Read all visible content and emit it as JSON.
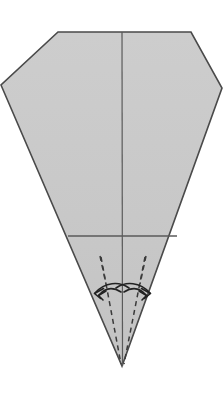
{
  "document": {
    "title": "Origami Fold Diagram",
    "type": "instructional-fold-step",
    "background_color": "#ffffff",
    "caption": ""
  },
  "figure": {
    "name": "kite-base-fold-step",
    "canvas": {
      "width": 223,
      "height": 393
    }
  },
  "style": {
    "paper_fill": "#c9c9c9",
    "paper_fill_light": "#cfcfcf",
    "outline_color": "#4a4a4a",
    "outline_width": 1.6,
    "crease_color": "#5a5a5a",
    "crease_width": 1.2,
    "dashed_color": "#3a3a3a",
    "dashed_width": 1.5,
    "dash_pattern": "5,4",
    "arrow_color": "#222222",
    "arrow_width": 1.6
  },
  "shapes": {
    "paper_outline": {
      "name": "paper-silhouette",
      "points": "58,32 191,32 222,88 122,366 1,85"
    },
    "center_crease": {
      "name": "center-vertical-crease",
      "x1": 122,
      "y1": 32,
      "x2": 122.5,
      "y2": 366
    },
    "horizontal_fold": {
      "name": "horizontal-fold-line",
      "x1": 68,
      "y1": 236,
      "x2": 177,
      "y2": 236
    }
  },
  "fold_lines": [
    {
      "name": "dashed-valley-fold-left",
      "x1": 101,
      "y1": 257,
      "x2": 121,
      "y2": 364
    },
    {
      "name": "dashed-valley-fold-right",
      "x1": 145,
      "y1": 257,
      "x2": 124,
      "y2": 364
    }
  ],
  "arrows": [
    {
      "name": "fold-arrow-left-outer",
      "path": "M 128,289 C 118,282 104,283 95,293",
      "head": "95,293 103,290 100,297"
    },
    {
      "name": "fold-arrow-left-inner",
      "path": "M 120,292 C 112,287 104,288 98,295",
      "head": "98,295 105,292 103,299"
    },
    {
      "name": "fold-arrow-right-outer",
      "path": "M 117,289 C 127,282 140,283 149,293",
      "head": "149,293 141,290 144,297"
    },
    {
      "name": "fold-arrow-right-inner",
      "path": "M 124,292 C 132,287 140,288 146,295",
      "head": "146,295 139,292 141,299"
    }
  ],
  "labels": {
    "step_number": "",
    "instruction": ""
  }
}
